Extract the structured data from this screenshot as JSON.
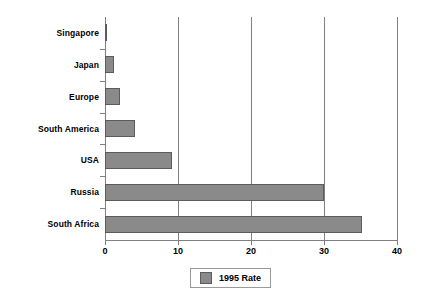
{
  "chart_data": {
    "type": "bar",
    "orientation": "horizontal",
    "title": "",
    "subtitle": "",
    "xlabel": "",
    "ylabel": "",
    "categories": [
      "Singapore",
      "Japan",
      "Europe",
      "South America",
      "USA",
      "Russia",
      "South Africa"
    ],
    "series": [
      {
        "name": "1995 Rate",
        "color": "#8a8a8a",
        "values": [
          0.2,
          1.3,
          2.1,
          4.1,
          9.2,
          30.0,
          35.2
        ]
      }
    ],
    "xlim": [
      0,
      40
    ],
    "xticks": [
      0,
      10,
      20,
      30,
      40
    ],
    "xtick_labels": [
      "0",
      "10",
      "20",
      "30",
      "40"
    ],
    "grid": "vertical",
    "legend": {
      "position": "bottom-center",
      "entries": [
        {
          "label": "1995 Rate",
          "swatch_color": "#8a8a8a"
        }
      ]
    },
    "colors": {
      "bar_fill": "#8a8a8a",
      "bar_edge": "#5b5b5b",
      "axis": "#808080",
      "gridline": "#808080",
      "background": "#ffffff",
      "text": "#000000"
    }
  }
}
